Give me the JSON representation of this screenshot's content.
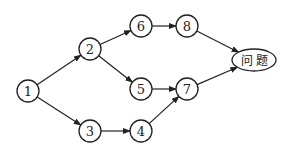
{
  "diagram": {
    "type": "directed-graph",
    "nodes": [
      {
        "id": "n1",
        "label": "1",
        "shape": "circle"
      },
      {
        "id": "n2",
        "label": "2",
        "shape": "circle"
      },
      {
        "id": "n3",
        "label": "3",
        "shape": "circle"
      },
      {
        "id": "n4",
        "label": "4",
        "shape": "circle"
      },
      {
        "id": "n5",
        "label": "5",
        "shape": "circle"
      },
      {
        "id": "n6",
        "label": "6",
        "shape": "circle"
      },
      {
        "id": "n7",
        "label": "7",
        "shape": "circle"
      },
      {
        "id": "n8",
        "label": "8",
        "shape": "circle"
      },
      {
        "id": "goal",
        "label": "问题",
        "shape": "ellipse"
      }
    ],
    "edges": [
      {
        "from": "n1",
        "to": "n2"
      },
      {
        "from": "n1",
        "to": "n3"
      },
      {
        "from": "n2",
        "to": "n6"
      },
      {
        "from": "n2",
        "to": "n5"
      },
      {
        "from": "n3",
        "to": "n4"
      },
      {
        "from": "n6",
        "to": "n8"
      },
      {
        "from": "n5",
        "to": "n7"
      },
      {
        "from": "n4",
        "to": "n7"
      },
      {
        "from": "n8",
        "to": "goal"
      },
      {
        "from": "n7",
        "to": "goal"
      }
    ]
  }
}
